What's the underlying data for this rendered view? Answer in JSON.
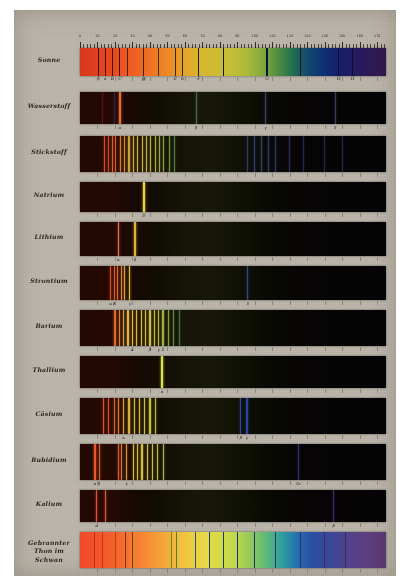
{
  "plate": {
    "background_color": "#b9b3a8",
    "title_present": false
  },
  "scale": {
    "label": "wavelength-scale",
    "ticks": [
      0,
      10,
      20,
      30,
      40,
      50,
      60,
      70,
      80,
      90,
      100,
      110,
      120,
      130,
      140,
      150,
      160,
      170
    ],
    "min": 0,
    "max": 175
  },
  "fraunhofer": {
    "letters": [
      {
        "label": "A",
        "pos": 10.5
      },
      {
        "label": "a",
        "pos": 14.5
      },
      {
        "label": "B",
        "pos": 18.5
      },
      {
        "label": "C",
        "pos": 22.8
      },
      {
        "label": "D",
        "pos": 36.5
      },
      {
        "label": "E",
        "pos": 54.5
      },
      {
        "label": "b",
        "pos": 58.5
      },
      {
        "label": "F",
        "pos": 68.0
      },
      {
        "label": "G",
        "pos": 107.0
      },
      {
        "label": "H",
        "pos": 148.0
      },
      {
        "label": "H",
        "pos": 156.0
      }
    ]
  },
  "chart_data": {
    "type": "heatmap",
    "xlabel": "Skalentheile",
    "ylabel": "",
    "xlim": [
      0,
      175
    ],
    "grid": false,
    "legend": "none",
    "rows": [
      {
        "name": "Sonne",
        "kind": "absorption",
        "continuum": true,
        "lines": [
          {
            "pos": 10.5,
            "color": "#3a1008",
            "width": 1.1,
            "label": "A"
          },
          {
            "pos": 14.5,
            "color": "#4a1508",
            "width": 0.8,
            "label": "a"
          },
          {
            "pos": 18.5,
            "color": "#3a1206",
            "width": 1.0,
            "label": "B"
          },
          {
            "pos": 22.8,
            "color": "#36110a",
            "width": 1.1,
            "label": "C"
          },
          {
            "pos": 27.0,
            "color": "#4a2008",
            "width": 0.7
          },
          {
            "pos": 36.5,
            "color": "#2f2a06",
            "width": 1.2,
            "label": "D"
          },
          {
            "pos": 45.0,
            "color": "#3a3508",
            "width": 0.6
          },
          {
            "pos": 54.5,
            "color": "#2a3008",
            "width": 1.0,
            "label": "E"
          },
          {
            "pos": 58.5,
            "color": "#223008",
            "width": 0.9,
            "label": "b"
          },
          {
            "pos": 68.0,
            "color": "#0d2035",
            "width": 1.1,
            "label": "F"
          },
          {
            "pos": 82.0,
            "color": "#0a1830",
            "width": 0.6
          },
          {
            "pos": 107.0,
            "color": "#0a1030",
            "width": 1.2,
            "label": "G"
          },
          {
            "pos": 126.0,
            "color": "#140f2c",
            "width": 0.6
          },
          {
            "pos": 148.0,
            "color": "#120c26",
            "width": 1.0,
            "label": "H"
          },
          {
            "pos": 156.0,
            "color": "#120c26",
            "width": 1.0,
            "label": "H"
          }
        ]
      },
      {
        "name": "Wasserstoff",
        "kind": "emission",
        "continuum": false,
        "lines": [
          {
            "pos": 13.0,
            "color": "#5a1008",
            "width": 0.7
          },
          {
            "pos": 19.5,
            "color": "#26283c",
            "width": 0.7
          },
          {
            "pos": 22.8,
            "color": "#e8693a",
            "width": 1.4,
            "label": "Halpha"
          },
          {
            "pos": 66.5,
            "color": "#3f6a4a",
            "width": 1.1,
            "label": "Hbeta"
          },
          {
            "pos": 106.0,
            "color": "#34406a",
            "width": 1.0,
            "label": "Hgamma"
          },
          {
            "pos": 146.0,
            "color": "#3a3a66",
            "width": 0.9,
            "label": "Hdelta"
          }
        ]
      },
      {
        "name": "Stickstoff",
        "kind": "emission-banded",
        "continuum": false,
        "lines": [
          {
            "pos": 14.0,
            "color": "#d24a28",
            "width": 1.6
          },
          {
            "pos": 16.5,
            "color": "#c84824",
            "width": 1.2
          },
          {
            "pos": 18.5,
            "color": "#d8632c",
            "width": 1.3
          },
          {
            "pos": 20.5,
            "color": "#cf5626",
            "width": 1.0
          },
          {
            "pos": 23.0,
            "color": "#dd7a30",
            "width": 1.2
          },
          {
            "pos": 25.5,
            "color": "#d98a34",
            "width": 1.0
          },
          {
            "pos": 28.0,
            "color": "#caa13a",
            "width": 1.1
          },
          {
            "pos": 30.5,
            "color": "#c9b03e",
            "width": 1.0
          },
          {
            "pos": 33.0,
            "color": "#c6b240",
            "width": 1.2
          },
          {
            "pos": 35.5,
            "color": "#c2b242",
            "width": 1.0
          },
          {
            "pos": 38.0,
            "color": "#bdb244",
            "width": 1.1
          },
          {
            "pos": 40.5,
            "color": "#b4b046",
            "width": 1.0
          },
          {
            "pos": 43.0,
            "color": "#a8ae46",
            "width": 1.1
          },
          {
            "pos": 45.5,
            "color": "#9aa846",
            "width": 1.0
          },
          {
            "pos": 48.0,
            "color": "#86a046",
            "width": 1.1
          },
          {
            "pos": 51.0,
            "color": "#6e9444",
            "width": 0.9
          },
          {
            "pos": 54.0,
            "color": "#4e7c40",
            "width": 0.8
          },
          {
            "pos": 96.0,
            "color": "#2c3a66",
            "width": 0.8
          },
          {
            "pos": 100.0,
            "color": "#2e3c6a",
            "width": 0.9
          },
          {
            "pos": 104.0,
            "color": "#30406e",
            "width": 0.9
          },
          {
            "pos": 108.0,
            "color": "#2e3e6c",
            "width": 0.8
          },
          {
            "pos": 112.0,
            "color": "#2a3a66",
            "width": 0.8
          },
          {
            "pos": 120.0,
            "color": "#262f5c",
            "width": 0.7
          },
          {
            "pos": 128.0,
            "color": "#222a52",
            "width": 0.7
          },
          {
            "pos": 140.0,
            "color": "#20264a",
            "width": 0.7
          },
          {
            "pos": 150.0,
            "color": "#1e2446",
            "width": 0.6
          }
        ]
      },
      {
        "name": "Natrium",
        "kind": "emission",
        "continuum": false,
        "lines": [
          {
            "pos": 36.5,
            "color": "#f2d23a",
            "width": 1.6,
            "label": "D"
          }
        ]
      },
      {
        "name": "Lithium",
        "kind": "emission",
        "continuum": false,
        "lines": [
          {
            "pos": 22.0,
            "color": "#e8704a",
            "width": 1.3,
            "label": "alpha"
          },
          {
            "pos": 31.5,
            "color": "#e0b23c",
            "width": 1.3,
            "label": "beta"
          }
        ]
      },
      {
        "name": "Strontium",
        "kind": "emission",
        "continuum": false,
        "lines": [
          {
            "pos": 17.5,
            "color": "#d8502c",
            "width": 1.0,
            "label": "alpha"
          },
          {
            "pos": 19.5,
            "color": "#dd5a2e",
            "width": 1.0,
            "label": "beta"
          },
          {
            "pos": 21.5,
            "color": "#e06430",
            "width": 1.0
          },
          {
            "pos": 23.5,
            "color": "#e08238",
            "width": 1.0
          },
          {
            "pos": 25.5,
            "color": "#dfa23c",
            "width": 1.0
          },
          {
            "pos": 28.5,
            "color": "#e0c040",
            "width": 1.2,
            "label": "gamma"
          },
          {
            "pos": 96.0,
            "color": "#2e4a80",
            "width": 0.9,
            "label": "delta"
          }
        ]
      },
      {
        "name": "Barium",
        "kind": "emission",
        "continuum": false,
        "lines": [
          {
            "pos": 20.0,
            "color": "#dc6a2e",
            "width": 1.2
          },
          {
            "pos": 22.5,
            "color": "#dd8234",
            "width": 1.2
          },
          {
            "pos": 25.0,
            "color": "#dea038",
            "width": 1.2
          },
          {
            "pos": 27.5,
            "color": "#deb23c",
            "width": 1.2
          },
          {
            "pos": 30.0,
            "color": "#dcbc3e",
            "width": 1.4,
            "label": "alpha"
          },
          {
            "pos": 32.5,
            "color": "#d8be40",
            "width": 1.2
          },
          {
            "pos": 35.0,
            "color": "#d4be42",
            "width": 1.2
          },
          {
            "pos": 37.5,
            "color": "#cfbe44",
            "width": 1.3
          },
          {
            "pos": 40.0,
            "color": "#c8bc46",
            "width": 1.3,
            "label": "beta"
          },
          {
            "pos": 42.5,
            "color": "#c0ba46",
            "width": 1.2
          },
          {
            "pos": 45.0,
            "color": "#b4b646",
            "width": 1.3,
            "label": "gamma"
          },
          {
            "pos": 47.5,
            "color": "#a2b046",
            "width": 1.2,
            "label": "delta"
          },
          {
            "pos": 50.5,
            "color": "#86a446",
            "width": 1.1
          },
          {
            "pos": 53.5,
            "color": "#5e8e42",
            "width": 1.0
          },
          {
            "pos": 57.0,
            "color": "#40763e",
            "width": 1.0
          }
        ]
      },
      {
        "name": "Thallium",
        "kind": "emission",
        "continuum": false,
        "lines": [
          {
            "pos": 47.0,
            "color": "#d8e04a",
            "width": 1.6,
            "label": "alpha"
          }
        ]
      },
      {
        "name": "Cäsium",
        "kind": "emission",
        "continuum": false,
        "lines": [
          {
            "pos": 13.5,
            "color": "#dc5030",
            "width": 1.0
          },
          {
            "pos": 16.5,
            "color": "#d84c2c",
            "width": 0.9
          },
          {
            "pos": 19.5,
            "color": "#d8642e",
            "width": 1.0
          },
          {
            "pos": 22.0,
            "color": "#d87834",
            "width": 1.0
          },
          {
            "pos": 25.0,
            "color": "#d99a38",
            "width": 1.0,
            "label": "alpha"
          },
          {
            "pos": 28.0,
            "color": "#d6b03c",
            "width": 1.1
          },
          {
            "pos": 31.0,
            "color": "#d4ba40",
            "width": 1.2
          },
          {
            "pos": 34.0,
            "color": "#d2be42",
            "width": 1.3
          },
          {
            "pos": 37.0,
            "color": "#cebe44",
            "width": 1.2
          },
          {
            "pos": 40.0,
            "color": "#c6bc46",
            "width": 1.2
          },
          {
            "pos": 43.0,
            "color": "#b8b846",
            "width": 1.0
          },
          {
            "pos": 92.0,
            "color": "#2c46a0",
            "width": 1.1,
            "label": "beta"
          },
          {
            "pos": 95.5,
            "color": "#2a42a0",
            "width": 1.1,
            "label": "gamma"
          }
        ]
      },
      {
        "name": "Rubidium",
        "kind": "emission",
        "continuum": false,
        "lines": [
          {
            "pos": 8.5,
            "color": "#e45830",
            "width": 1.3,
            "label": "alpha"
          },
          {
            "pos": 11.0,
            "color": "#e05a30",
            "width": 1.2,
            "label": "beta"
          },
          {
            "pos": 22.0,
            "color": "#d86030",
            "width": 1.0
          },
          {
            "pos": 24.0,
            "color": "#d87432",
            "width": 1.0
          },
          {
            "pos": 26.5,
            "color": "#d89036",
            "width": 1.0,
            "label": "gamma"
          },
          {
            "pos": 30.5,
            "color": "#d6b63e",
            "width": 1.2
          },
          {
            "pos": 33.0,
            "color": "#d4bc40",
            "width": 1.2
          },
          {
            "pos": 35.5,
            "color": "#d2be42",
            "width": 1.3
          },
          {
            "pos": 38.5,
            "color": "#cfbe44",
            "width": 1.2
          },
          {
            "pos": 41.5,
            "color": "#c8bc46",
            "width": 1.2
          },
          {
            "pos": 44.5,
            "color": "#bcba46",
            "width": 1.2
          },
          {
            "pos": 47.5,
            "color": "#a8b246",
            "width": 1.1
          },
          {
            "pos": 125.0,
            "color": "#3a2c72",
            "width": 1.1,
            "label": "deltaepsilon"
          }
        ]
      },
      {
        "name": "Kalium",
        "kind": "emission",
        "continuum": false,
        "lines": [
          {
            "pos": 9.5,
            "color": "#e05030",
            "width": 1.1,
            "label": "alpha"
          },
          {
            "pos": 14.5,
            "color": "#e25632",
            "width": 1.3
          },
          {
            "pos": 145.0,
            "color": "#3c2a68",
            "width": 1.0,
            "label": "beta"
          }
        ]
      },
      {
        "name": "Gebrannter\nThon im\nSchwan",
        "kind": "continuous",
        "continuum": true,
        "lines": [
          {
            "pos": 8.0,
            "color": "#c03018",
            "width": 0.8
          },
          {
            "pos": 13.0,
            "color": "#c03a18",
            "width": 0.8
          },
          {
            "pos": 20.0,
            "color": "#b8400f",
            "width": 0.9
          },
          {
            "pos": 26.0,
            "color": "#7a3a08",
            "width": 1.0
          },
          {
            "pos": 30.0,
            "color": "#6a4208",
            "width": 0.8
          },
          {
            "pos": 52.0,
            "color": "#6a8a18",
            "width": 0.8
          },
          {
            "pos": 55.0,
            "color": "#4e8020",
            "width": 0.8
          },
          {
            "pos": 66.0,
            "color": "#1f5a70",
            "width": 0.9
          },
          {
            "pos": 74.0,
            "color": "#1c3f82",
            "width": 0.9
          },
          {
            "pos": 82.0,
            "color": "#1a3580",
            "width": 0.8
          },
          {
            "pos": 90.0,
            "color": "#222e78",
            "width": 0.8
          },
          {
            "pos": 100.0,
            "color": "#2a2c70",
            "width": 0.8
          },
          {
            "pos": 112.0,
            "color": "#332a66",
            "width": 0.8
          },
          {
            "pos": 126.0,
            "color": "#3a2a60",
            "width": 0.8
          },
          {
            "pos": 140.0,
            "color": "#402a5c",
            "width": 0.8
          },
          {
            "pos": 152.0,
            "color": "#3e2656",
            "width": 0.8
          }
        ]
      }
    ]
  },
  "row_labels": [
    "Sonne",
    "Wasserstoff",
    "Stickstoff",
    "Natrium",
    "Lithium",
    "Strontium",
    "Barium",
    "Thallium",
    "Cäsium",
    "Rubidium",
    "Kalium",
    "Gebrannter Thon im Schwan"
  ]
}
